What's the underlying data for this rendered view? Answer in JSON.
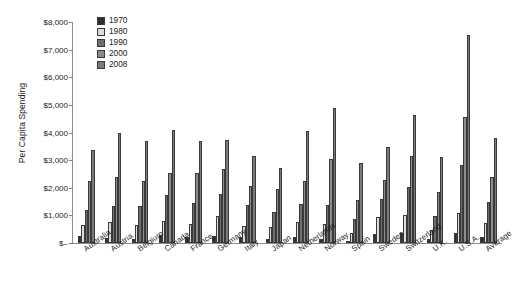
{
  "chart_data": {
    "type": "bar",
    "title": "",
    "xlabel": "",
    "ylabel": "Per Capita Spending",
    "ylim": [
      0,
      8000
    ],
    "ytick_values": [
      0,
      1000,
      2000,
      3000,
      4000,
      5000,
      6000,
      7000,
      8000
    ],
    "ytick_labels": [
      "$–",
      "$1,000",
      "$2,000",
      "$3,000",
      "$4,000",
      "$5,000",
      "$6,000",
      "$7,000",
      "$8,000"
    ],
    "grid": false,
    "legend_position": "top-left-inside",
    "categories": [
      "Australia",
      "Austria",
      "Belgium",
      "Canada",
      "France",
      "Germany",
      "Italy",
      "Japan",
      "Netherlands",
      "Norway",
      "Spain",
      "Sweden",
      "Switzerland",
      "U.K.",
      "U.S.A.",
      "Average"
    ],
    "series": [
      {
        "name": "1970",
        "color": "#2e2e2e",
        "values": [
          250,
          190,
          150,
          300,
          200,
          270,
          220,
          150,
          210,
          140,
          90,
          310,
          350,
          160,
          360,
          220
        ]
      },
      {
        "name": "1980",
        "color": "#dcdcdc",
        "values": [
          660,
          760,
          640,
          780,
          680,
          960,
          600,
          580,
          760,
          680,
          360,
          940,
          1030,
          480,
          1100,
          720
        ]
      },
      {
        "name": "1990",
        "color": "#6e6e6e",
        "values": [
          1200,
          1340,
          1340,
          1740,
          1450,
          1760,
          1390,
          1110,
          1410,
          1390,
          880,
          1580,
          2030,
          980,
          2810,
          1480
        ]
      },
      {
        "name": "2000",
        "color": "#8c8c8c",
        "values": [
          2250,
          2390,
          2250,
          2520,
          2550,
          2680,
          2050,
          1970,
          2260,
          3040,
          1540,
          2290,
          3160,
          1830,
          4560,
          2400
        ]
      },
      {
        "name": "2008",
        "color": "#7a7a7a",
        "values": [
          3350,
          3970,
          3680,
          4080,
          3690,
          3740,
          3140,
          2730,
          4060,
          4870,
          2900,
          3470,
          4620,
          3130,
          7530,
          3810
        ]
      }
    ]
  }
}
